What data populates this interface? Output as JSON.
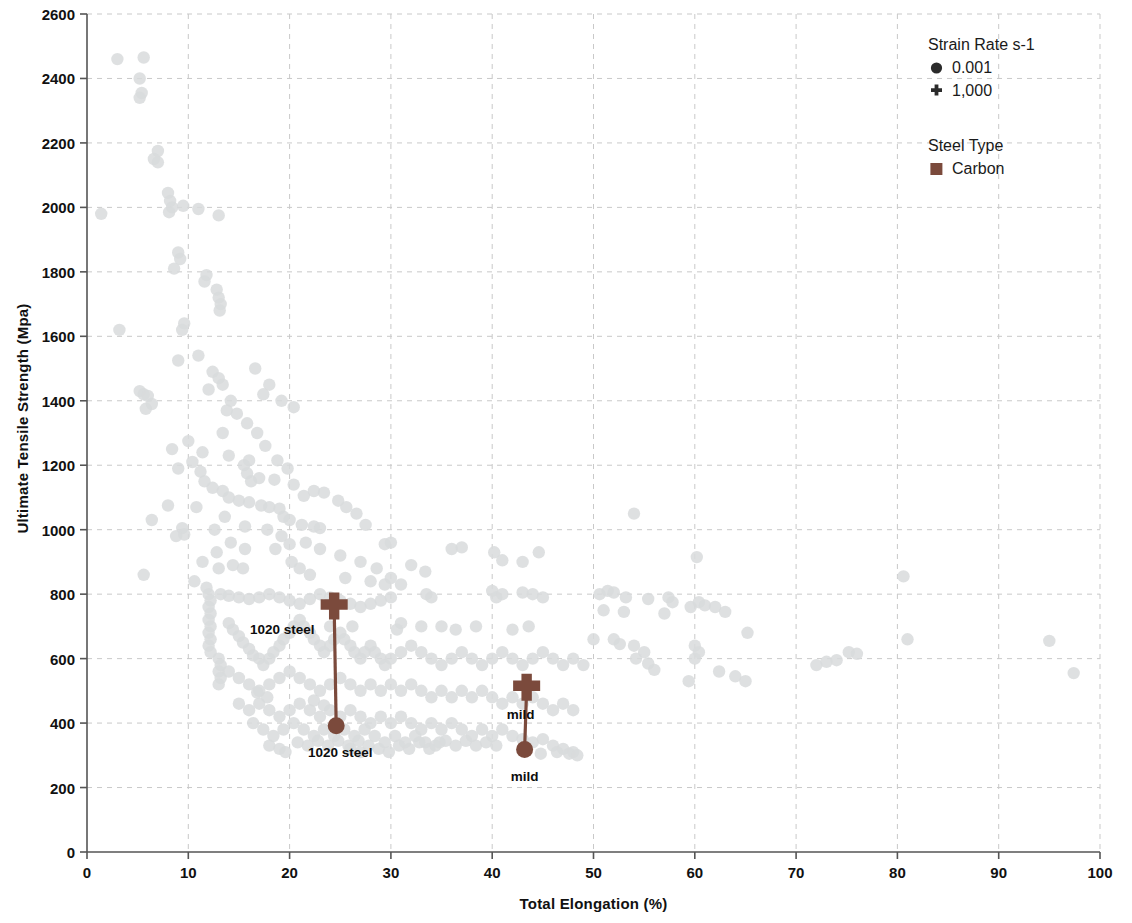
{
  "chart_data": {
    "type": "scatter",
    "title": "",
    "xlabel": "Total Elongation (%)",
    "ylabel": "Ultimate Tensile Strength (Mpa)",
    "xlim": [
      0,
      100
    ],
    "ylim": [
      0,
      2600
    ],
    "xticks": [
      0,
      10,
      20,
      30,
      40,
      50,
      60,
      70,
      80,
      90,
      100
    ],
    "yticks": [
      0,
      200,
      400,
      600,
      800,
      1000,
      1200,
      1400,
      1600,
      1800,
      2000,
      2200,
      2400,
      2600
    ],
    "grid": true,
    "grid_style": "dashed",
    "background_color": "#ffffff",
    "background_point_color": "#d8dadc",
    "highlight_color": "#7b4a3c",
    "legend_position": "top-right",
    "legends": [
      {
        "title": "Strain Rate s-1",
        "entries": [
          {
            "label": "0.001",
            "marker": "circle"
          },
          {
            "label": "1,000",
            "marker": "plus"
          }
        ]
      },
      {
        "title": "Steel Type",
        "entries": [
          {
            "label": "Carbon",
            "marker": "square",
            "color": "#7b4a3c"
          }
        ]
      }
    ],
    "highlighted_series": [
      {
        "name": "1020 steel",
        "color": "#7b4a3c",
        "points": [
          {
            "x": 24.4,
            "y": 760,
            "marker": "plus",
            "label": "1020 steel",
            "label_dx": -52,
            "label_dy": 22
          },
          {
            "x": 24.6,
            "y": 392,
            "marker": "circle",
            "label": "1020 steel",
            "label_dx": 4,
            "label_dy": 26
          }
        ]
      },
      {
        "name": "mild",
        "color": "#7b4a3c",
        "points": [
          {
            "x": 43.4,
            "y": 508,
            "marker": "plus",
            "label": "mild",
            "label_dx": -6,
            "label_dy": 26
          },
          {
            "x": 43.2,
            "y": 318,
            "marker": "circle",
            "label": "mild",
            "label_dx": 0,
            "label_dy": 26
          }
        ]
      }
    ],
    "background_points": [
      [
        1.4,
        1980
      ],
      [
        3.0,
        2460
      ],
      [
        5.6,
        2465
      ],
      [
        5.2,
        2400
      ],
      [
        5.4,
        2355
      ],
      [
        5.2,
        2340
      ],
      [
        7.0,
        2175
      ],
      [
        6.6,
        2150
      ],
      [
        7.0,
        2140
      ],
      [
        8.0,
        2045
      ],
      [
        8.2,
        2020
      ],
      [
        8.4,
        2000
      ],
      [
        8.1,
        1985
      ],
      [
        9.5,
        2005
      ],
      [
        11.0,
        1995
      ],
      [
        13.0,
        1975
      ],
      [
        9.0,
        1860
      ],
      [
        9.2,
        1840
      ],
      [
        11.8,
        1790
      ],
      [
        11.6,
        1770
      ],
      [
        8.6,
        1810
      ],
      [
        13.0,
        1720
      ],
      [
        13.2,
        1700
      ],
      [
        13.1,
        1680
      ],
      [
        12.8,
        1745
      ],
      [
        9.6,
        1640
      ],
      [
        9.4,
        1620
      ],
      [
        3.2,
        1620
      ],
      [
        9.0,
        1525
      ],
      [
        11.0,
        1540
      ],
      [
        12.4,
        1490
      ],
      [
        13.0,
        1470
      ],
      [
        13.4,
        1450
      ],
      [
        12.0,
        1435
      ],
      [
        5.2,
        1430
      ],
      [
        5.6,
        1420
      ],
      [
        6.0,
        1415
      ],
      [
        6.4,
        1390
      ],
      [
        5.8,
        1375
      ],
      [
        14.2,
        1400
      ],
      [
        13.8,
        1370
      ],
      [
        10.0,
        1275
      ],
      [
        11.4,
        1240
      ],
      [
        9.0,
        1190
      ],
      [
        11.2,
        1180
      ],
      [
        14.0,
        1230
      ],
      [
        16.0,
        1215
      ],
      [
        15.5,
        1200
      ],
      [
        15.8,
        1175
      ],
      [
        16.2,
        1150
      ],
      [
        17.0,
        1160
      ],
      [
        18.5,
        1155
      ],
      [
        13.4,
        1120
      ],
      [
        14.0,
        1100
      ],
      [
        15.0,
        1090
      ],
      [
        16.0,
        1085
      ],
      [
        17.2,
        1075
      ],
      [
        18.0,
        1070
      ],
      [
        19.0,
        1065
      ],
      [
        8.0,
        1075
      ],
      [
        6.4,
        1030
      ],
      [
        9.4,
        1005
      ],
      [
        9.6,
        985
      ],
      [
        8.8,
        980
      ],
      [
        19.4,
        1040
      ],
      [
        20.0,
        1030
      ],
      [
        21.2,
        1015
      ],
      [
        22.4,
        1010
      ],
      [
        23.0,
        1005
      ],
      [
        27.5,
        1015
      ],
      [
        29.4,
        955
      ],
      [
        30.0,
        960
      ],
      [
        36.0,
        940
      ],
      [
        37.0,
        945
      ],
      [
        40.2,
        930
      ],
      [
        41.0,
        905
      ],
      [
        44.6,
        930
      ],
      [
        43.0,
        900
      ],
      [
        54.0,
        1050
      ],
      [
        60.2,
        915
      ],
      [
        80.6,
        855
      ],
      [
        5.6,
        860
      ],
      [
        14.4,
        890
      ],
      [
        15.4,
        880
      ],
      [
        20.2,
        900
      ],
      [
        21.0,
        880
      ],
      [
        22.0,
        860
      ],
      [
        25.5,
        850
      ],
      [
        28.0,
        840
      ],
      [
        29.4,
        830
      ],
      [
        12.0,
        800
      ],
      [
        12.2,
        780
      ],
      [
        12.0,
        760
      ],
      [
        12.2,
        740
      ],
      [
        12.0,
        720
      ],
      [
        12.2,
        700
      ],
      [
        12.0,
        680
      ],
      [
        12.2,
        660
      ],
      [
        12.0,
        640
      ],
      [
        12.2,
        620
      ],
      [
        13.2,
        800
      ],
      [
        14.0,
        795
      ],
      [
        15.0,
        790
      ],
      [
        16.0,
        785
      ],
      [
        17.0,
        790
      ],
      [
        18.0,
        800
      ],
      [
        19.0,
        790
      ],
      [
        20.0,
        780
      ],
      [
        21.0,
        770
      ],
      [
        22.0,
        785
      ],
      [
        23.0,
        800
      ],
      [
        24.0,
        790
      ],
      [
        25.0,
        780
      ],
      [
        26.0,
        770
      ],
      [
        27.0,
        760
      ],
      [
        28.0,
        770
      ],
      [
        29.0,
        780
      ],
      [
        30.0,
        790
      ],
      [
        33.5,
        800
      ],
      [
        34.0,
        790
      ],
      [
        40.0,
        810
      ],
      [
        40.4,
        790
      ],
      [
        41.0,
        800
      ],
      [
        43.0,
        805
      ],
      [
        44.0,
        800
      ],
      [
        45.0,
        790
      ],
      [
        50.6,
        800
      ],
      [
        51.4,
        810
      ],
      [
        52.0,
        805
      ],
      [
        53.2,
        790
      ],
      [
        55.4,
        785
      ],
      [
        57.4,
        790
      ],
      [
        57.8,
        775
      ],
      [
        59.6,
        760
      ],
      [
        60.4,
        775
      ],
      [
        61.0,
        765
      ],
      [
        62.0,
        760
      ],
      [
        63.0,
        745
      ],
      [
        65.2,
        680
      ],
      [
        57.0,
        740
      ],
      [
        53.0,
        745
      ],
      [
        51.0,
        750
      ],
      [
        13.0,
        600
      ],
      [
        13.2,
        580
      ],
      [
        13.0,
        560
      ],
      [
        13.2,
        540
      ],
      [
        13.0,
        520
      ],
      [
        14.0,
        710
      ],
      [
        14.4,
        690
      ],
      [
        15.0,
        670
      ],
      [
        15.4,
        650
      ],
      [
        16.0,
        630
      ],
      [
        16.4,
        610
      ],
      [
        17.0,
        600
      ],
      [
        17.4,
        580
      ],
      [
        18.0,
        600
      ],
      [
        18.4,
        620
      ],
      [
        19.0,
        640
      ],
      [
        19.4,
        660
      ],
      [
        20.0,
        680
      ],
      [
        20.4,
        700
      ],
      [
        21.0,
        720
      ],
      [
        21.4,
        700
      ],
      [
        22.0,
        680
      ],
      [
        22.4,
        660
      ],
      [
        23.0,
        640
      ],
      [
        23.4,
        620
      ],
      [
        24.0,
        640
      ],
      [
        24.4,
        660
      ],
      [
        25.0,
        680
      ],
      [
        25.4,
        660
      ],
      [
        26.0,
        640
      ],
      [
        26.4,
        620
      ],
      [
        27.0,
        600
      ],
      [
        27.4,
        620
      ],
      [
        28.0,
        640
      ],
      [
        28.4,
        620
      ],
      [
        29.0,
        600
      ],
      [
        29.4,
        580
      ],
      [
        30.0,
        600
      ],
      [
        31.0,
        620
      ],
      [
        32.0,
        640
      ],
      [
        33.0,
        620
      ],
      [
        34.0,
        600
      ],
      [
        35.0,
        580
      ],
      [
        36.0,
        600
      ],
      [
        37.0,
        620
      ],
      [
        38.0,
        600
      ],
      [
        39.0,
        580
      ],
      [
        40.0,
        600
      ],
      [
        41.0,
        620
      ],
      [
        42.0,
        600
      ],
      [
        43.0,
        580
      ],
      [
        44.0,
        600
      ],
      [
        45.0,
        620
      ],
      [
        46.0,
        600
      ],
      [
        47.0,
        580
      ],
      [
        48.0,
        600
      ],
      [
        49.0,
        580
      ],
      [
        14.0,
        560
      ],
      [
        15.0,
        540
      ],
      [
        16.0,
        520
      ],
      [
        17.0,
        500
      ],
      [
        18.0,
        520
      ],
      [
        19.0,
        540
      ],
      [
        20.0,
        560
      ],
      [
        21.0,
        540
      ],
      [
        22.0,
        520
      ],
      [
        23.0,
        500
      ],
      [
        24.0,
        520
      ],
      [
        25.0,
        540
      ],
      [
        26.0,
        520
      ],
      [
        27.0,
        500
      ],
      [
        28.0,
        520
      ],
      [
        29.0,
        500
      ],
      [
        30.0,
        520
      ],
      [
        31.0,
        500
      ],
      [
        32.0,
        520
      ],
      [
        33.0,
        500
      ],
      [
        34.0,
        480
      ],
      [
        35.0,
        500
      ],
      [
        36.0,
        480
      ],
      [
        37.0,
        500
      ],
      [
        38.0,
        480
      ],
      [
        39.0,
        500
      ],
      [
        40.0,
        480
      ],
      [
        41.0,
        460
      ],
      [
        42.0,
        480
      ],
      [
        43.0,
        460
      ],
      [
        44.0,
        480
      ],
      [
        45.0,
        460
      ],
      [
        46.0,
        440
      ],
      [
        47.0,
        460
      ],
      [
        48.0,
        440
      ],
      [
        15.0,
        460
      ],
      [
        16.0,
        440
      ],
      [
        17.0,
        460
      ],
      [
        18.0,
        440
      ],
      [
        19.0,
        420
      ],
      [
        20.0,
        440
      ],
      [
        21.0,
        460
      ],
      [
        22.0,
        440
      ],
      [
        23.0,
        420
      ],
      [
        24.0,
        440
      ],
      [
        25.0,
        420
      ],
      [
        26.0,
        440
      ],
      [
        27.0,
        420
      ],
      [
        28.0,
        400
      ],
      [
        29.0,
        420
      ],
      [
        30.0,
        400
      ],
      [
        31.0,
        420
      ],
      [
        32.0,
        400
      ],
      [
        33.0,
        380
      ],
      [
        34.0,
        400
      ],
      [
        35.0,
        380
      ],
      [
        36.0,
        400
      ],
      [
        37.0,
        380
      ],
      [
        38.0,
        360
      ],
      [
        39.0,
        380
      ],
      [
        40.0,
        360
      ],
      [
        41.0,
        380
      ],
      [
        42.0,
        360
      ],
      [
        43.0,
        350
      ],
      [
        44.0,
        340
      ],
      [
        45.0,
        350
      ],
      [
        46.0,
        330
      ],
      [
        47.0,
        320
      ],
      [
        48.0,
        310
      ],
      [
        44.8,
        305
      ],
      [
        46.4,
        310
      ],
      [
        47.6,
        305
      ],
      [
        48.4,
        300
      ],
      [
        16.4,
        400
      ],
      [
        17.4,
        380
      ],
      [
        18.4,
        360
      ],
      [
        19.4,
        380
      ],
      [
        20.4,
        400
      ],
      [
        21.4,
        380
      ],
      [
        22.4,
        360
      ],
      [
        23.4,
        380
      ],
      [
        24.4,
        360
      ],
      [
        25.4,
        380
      ],
      [
        26.4,
        360
      ],
      [
        27.4,
        380
      ],
      [
        28.4,
        360
      ],
      [
        29.4,
        340
      ],
      [
        30.4,
        360
      ],
      [
        31.4,
        340
      ],
      [
        32.4,
        360
      ],
      [
        33.4,
        340
      ],
      [
        34.4,
        330
      ],
      [
        35.4,
        345
      ],
      [
        36.4,
        330
      ],
      [
        37.4,
        345
      ],
      [
        38.4,
        330
      ],
      [
        39.4,
        340
      ],
      [
        40.4,
        330
      ],
      [
        20.8,
        340
      ],
      [
        21.8,
        330
      ],
      [
        22.8,
        345
      ],
      [
        23.8,
        330
      ],
      [
        24.8,
        345
      ],
      [
        25.8,
        330
      ],
      [
        26.8,
        345
      ],
      [
        27.8,
        330
      ],
      [
        28.8,
        320
      ],
      [
        29.8,
        310
      ],
      [
        30.8,
        330
      ],
      [
        31.8,
        320
      ],
      [
        32.8,
        340
      ],
      [
        33.8,
        320
      ],
      [
        34.8,
        340
      ],
      [
        18.0,
        330
      ],
      [
        19.0,
        320
      ],
      [
        19.6,
        310
      ],
      [
        26.0,
        320
      ],
      [
        27.0,
        310
      ],
      [
        72.0,
        580
      ],
      [
        73.0,
        590
      ],
      [
        74.0,
        595
      ],
      [
        75.2,
        620
      ],
      [
        76.0,
        615
      ],
      [
        81.0,
        660
      ],
      [
        95.0,
        655
      ],
      [
        97.4,
        555
      ],
      [
        64.0,
        545
      ],
      [
        62.4,
        560
      ],
      [
        65.0,
        530
      ],
      [
        60.0,
        640
      ],
      [
        60.4,
        620
      ],
      [
        60.0,
        600
      ],
      [
        59.4,
        530
      ],
      [
        54.0,
        640
      ],
      [
        55.0,
        620
      ],
      [
        54.2,
        600
      ],
      [
        55.4,
        585
      ],
      [
        56.0,
        565
      ],
      [
        52.0,
        660
      ],
      [
        52.6,
        645
      ],
      [
        50.0,
        660
      ],
      [
        43.6,
        700
      ],
      [
        42.0,
        690
      ],
      [
        38.4,
        700
      ],
      [
        36.4,
        690
      ],
      [
        35.0,
        700
      ],
      [
        33.0,
        700
      ],
      [
        31.0,
        710
      ],
      [
        30.6,
        690
      ],
      [
        26.2,
        700
      ],
      [
        24.0,
        700
      ],
      [
        30.0,
        850
      ],
      [
        31.0,
        830
      ],
      [
        22.4,
        470
      ],
      [
        23.4,
        455
      ],
      [
        17.8,
        480
      ],
      [
        16.8,
        495
      ],
      [
        11.4,
        900
      ],
      [
        12.8,
        930
      ],
      [
        15.6,
        1010
      ],
      [
        17.8,
        1000
      ],
      [
        19.2,
        980
      ],
      [
        13.6,
        1040
      ],
      [
        21.4,
        1105
      ],
      [
        22.4,
        1120
      ],
      [
        23.4,
        1115
      ],
      [
        20.4,
        1140
      ],
      [
        24.8,
        1090
      ],
      [
        25.6,
        1070
      ],
      [
        26.6,
        1050
      ],
      [
        18.8,
        1215
      ],
      [
        19.8,
        1190
      ],
      [
        17.6,
        1260
      ],
      [
        16.8,
        1300
      ],
      [
        15.8,
        1330
      ],
      [
        14.8,
        1360
      ],
      [
        13.4,
        1300
      ],
      [
        16.6,
        1500
      ],
      [
        18.0,
        1450
      ],
      [
        17.4,
        1420
      ],
      [
        19.2,
        1400
      ],
      [
        20.4,
        1380
      ],
      [
        8.4,
        1250
      ],
      [
        10.4,
        1210
      ],
      [
        11.6,
        1150
      ],
      [
        12.4,
        1130
      ],
      [
        10.8,
        1070
      ],
      [
        12.6,
        1000
      ],
      [
        14.2,
        960
      ],
      [
        15.6,
        940
      ],
      [
        13.0,
        880
      ],
      [
        10.6,
        840
      ],
      [
        11.8,
        820
      ],
      [
        32.0,
        890
      ],
      [
        33.4,
        870
      ],
      [
        28.6,
        880
      ],
      [
        27.0,
        900
      ],
      [
        25.0,
        920
      ],
      [
        23.0,
        940
      ],
      [
        21.6,
        960
      ],
      [
        20.0,
        955
      ],
      [
        18.6,
        940
      ]
    ]
  }
}
